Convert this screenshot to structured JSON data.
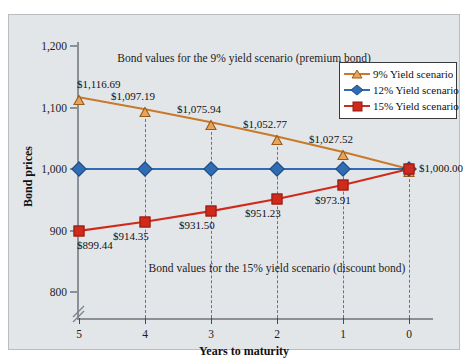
{
  "chart_data": {
    "type": "line",
    "title": "",
    "xlabel": "Years to maturity",
    "ylabel": "Bond prices",
    "x": [
      5,
      4,
      3,
      2,
      1,
      0
    ],
    "xticklabels": [
      "5",
      "4",
      "3",
      "2",
      "1",
      "0"
    ],
    "xlim": [
      5,
      0
    ],
    "ylim": [
      800,
      1200
    ],
    "yticks": [
      800,
      900,
      1000,
      1100,
      1200
    ],
    "yticklabels": [
      "800",
      "900",
      "1,000",
      "1,100",
      "1,200"
    ],
    "y_axis_break": true,
    "grid": false,
    "legend_position": "top-right",
    "series": [
      {
        "name": "9% Yield scenario",
        "color": "#c87a2a",
        "marker": "triangle",
        "values": [
          1116.69,
          1097.19,
          1075.94,
          1052.77,
          1027.52,
          1000.0
        ],
        "data_labels": [
          "$1,116.69",
          "$1,097.19",
          "$1,075.94",
          "$1,052.77",
          "$1,027.52",
          "$1,000.00"
        ]
      },
      {
        "name": "12% Yield scenario",
        "color": "#2f6cb3",
        "marker": "diamond",
        "values": [
          1000.0,
          1000.0,
          1000.0,
          1000.0,
          1000.0,
          1000.0
        ],
        "data_labels": [
          "",
          "",
          "",
          "",
          "",
          ""
        ]
      },
      {
        "name": "15% Yield scenario",
        "color": "#cf2a1b",
        "marker": "square",
        "values": [
          899.44,
          914.35,
          931.5,
          951.23,
          973.91,
          1000.0
        ],
        "data_labels": [
          "$899.44",
          "$914.35",
          "$931.50",
          "$951.23",
          "$973.91",
          ""
        ]
      }
    ],
    "annotations": [
      {
        "text": "Bond values for the 9% yield scenario (premium bond)",
        "x": 2.5,
        "y": 1190
      },
      {
        "text": "Bond values for the 15% yield scenario (discount bond)",
        "x": 2.0,
        "y": 848
      }
    ]
  },
  "legend": {
    "items": [
      {
        "label": "9% Yield scenario"
      },
      {
        "label": "12% Yield scenario"
      },
      {
        "label": "15% Yield scenario"
      }
    ]
  }
}
